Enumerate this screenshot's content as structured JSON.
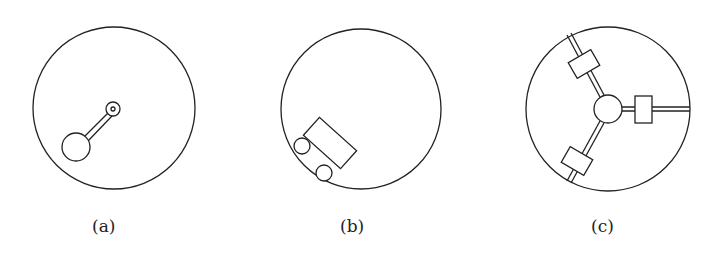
{
  "figure": {
    "panels": [
      {
        "id": "a",
        "label": "(a)",
        "description": "pendulum: bob on rod attached to pivot inside circle"
      },
      {
        "id": "b",
        "label": "(b)",
        "description": "two-wheeled cart rolling on inside of circle"
      },
      {
        "id": "c",
        "label": "(c)",
        "description": "central hub with three spokes carrying sliding blocks"
      }
    ],
    "colors": {
      "stroke": "#222222",
      "background": "#ffffff"
    }
  }
}
